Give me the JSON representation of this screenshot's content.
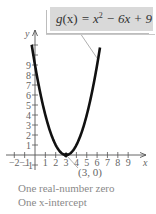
{
  "chart_data": {
    "type": "line",
    "function": "x^2 - 6x + 9",
    "xlabel": "x",
    "ylabel": "y",
    "xlim": [
      -2.5,
      10.5
    ],
    "ylim": [
      -1.5,
      11.5
    ],
    "x_ticks": [
      -2,
      -1,
      1,
      2,
      3,
      4,
      5,
      6,
      7,
      8,
      9
    ],
    "y_ticks": [
      -1,
      1,
      2,
      3,
      4,
      5,
      6,
      7,
      8,
      9
    ],
    "series": [
      {
        "name": "g(x) = x^2 - 6x + 9",
        "x": [
          -0.3,
          0,
          0.5,
          1,
          1.5,
          2,
          2.5,
          3,
          3.5,
          4,
          4.5,
          5,
          5.5,
          6,
          6.3
        ],
        "y": [
          10.89,
          9,
          6.25,
          4,
          2.25,
          1,
          0.25,
          0,
          0.25,
          1,
          2.25,
          4,
          6.25,
          9,
          10.89
        ]
      }
    ],
    "annotations": [
      {
        "text": "(3, 0)",
        "point": [
          3,
          0
        ]
      },
      {
        "text": "g(x) = x² − 6x + 9",
        "target": "curve"
      }
    ],
    "grid": false
  },
  "labels": {
    "equation_func": "g",
    "equation_arg": "(x)",
    "equation_rhs_a": " = x",
    "equation_exp": "2",
    "equation_rhs_b": " − 6x + 9",
    "vertex_label": "(3, 0)",
    "x_axis": "x",
    "y_axis": "y",
    "caption_line1": "One real-number zero",
    "caption_line2": "One x-intercept"
  },
  "colors": {
    "curve": "#111111",
    "axis": "#555555",
    "text": "#8a8a8a",
    "box": "#d9d9d9"
  }
}
